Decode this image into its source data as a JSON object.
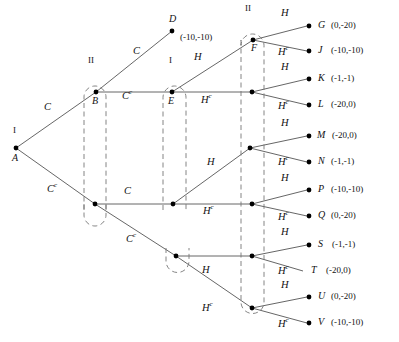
{
  "diagram": {
    "colors": {
      "line": "#555555",
      "dashed": "#777777",
      "node": "#000000",
      "text": "#111111"
    },
    "actions": {
      "C": "C",
      "Cc": "C",
      "Cc_sup": "c",
      "H": "H",
      "Hc": "H",
      "Hc_sup": "c"
    },
    "players": {
      "one": "I",
      "two": "II"
    },
    "decision_nodes": [
      {
        "id": "A",
        "label": "A",
        "player": "I",
        "x": 16,
        "y": 148
      },
      {
        "id": "B",
        "label": "B",
        "player": "II",
        "x": 96,
        "y": 92
      },
      {
        "id": "B2",
        "label": "",
        "player": "II",
        "x": 95,
        "y": 204
      },
      {
        "id": "E",
        "label": "E",
        "player": "I",
        "x": 172,
        "y": 92
      },
      {
        "id": "E2",
        "label": "",
        "player": "I",
        "x": 173,
        "y": 204
      },
      {
        "id": "E3",
        "label": "",
        "player": "I",
        "x": 176,
        "y": 256
      },
      {
        "id": "F",
        "label": "F",
        "player": "II",
        "x": 253,
        "y": 40
      },
      {
        "id": "F2",
        "label": "",
        "player": "II",
        "x": 252,
        "y": 92
      },
      {
        "id": "F3",
        "label": "",
        "player": "II",
        "x": 250,
        "y": 148
      },
      {
        "id": "F4",
        "label": "",
        "player": "II",
        "x": 252,
        "y": 204
      },
      {
        "id": "F5",
        "label": "",
        "player": "II",
        "x": 252,
        "y": 256
      },
      {
        "id": "F6",
        "label": "",
        "player": "II",
        "x": 252,
        "y": 308
      }
    ],
    "terminal_nodes": [
      {
        "id": "D",
        "label": "D",
        "payoff": "(-10,-10)",
        "x": 172,
        "y": 31
      },
      {
        "id": "G",
        "label": "G",
        "payoff": "(0,-20)",
        "x": 313,
        "y": 26
      },
      {
        "id": "J",
        "label": "J",
        "payoff": "(-10,-10)",
        "x": 313,
        "y": 51
      },
      {
        "id": "K",
        "label": "K",
        "payoff": "(-1,-1)",
        "x": 313,
        "y": 79
      },
      {
        "id": "L",
        "label": "L",
        "payoff": "(-20,0)",
        "x": 313,
        "y": 105
      },
      {
        "id": "M",
        "label": "M",
        "payoff": "(-20,0)",
        "x": 313,
        "y": 136
      },
      {
        "id": "N",
        "label": "N",
        "payoff": "(-1,-1)",
        "x": 313,
        "y": 162
      },
      {
        "id": "P",
        "label": "P",
        "payoff": "(-10,-10)",
        "x": 313,
        "y": 190
      },
      {
        "id": "Q",
        "label": "Q",
        "payoff": "(0,-20)",
        "x": 313,
        "y": 216
      },
      {
        "id": "S",
        "label": "S",
        "payoff": "(-1,-1)",
        "x": 313,
        "y": 245
      },
      {
        "id": "T",
        "label": "T",
        "payoff": "(-20,0)",
        "x": 313,
        "y": 271
      },
      {
        "id": "U",
        "label": "U",
        "payoff": "(0,-20)",
        "x": 313,
        "y": 297
      },
      {
        "id": "V",
        "label": "V",
        "payoff": "(-10,-10)",
        "x": 313,
        "y": 323
      }
    ],
    "edge_labels": [
      {
        "text": "C",
        "sup": "",
        "x": 44,
        "y": 108
      },
      {
        "text": "C",
        "sup": "c",
        "x": 47,
        "y": 188
      },
      {
        "text": "C",
        "sup": "",
        "x": 133,
        "y": 52
      },
      {
        "text": "C",
        "sup": "c",
        "x": 124,
        "y": 95
      },
      {
        "text": "C",
        "sup": "",
        "x": 126,
        "y": 192
      },
      {
        "text": "C",
        "sup": "c",
        "x": 128,
        "y": 238
      },
      {
        "text": "H",
        "sup": "",
        "x": 196,
        "y": 58
      },
      {
        "text": "H",
        "sup": "c",
        "x": 203,
        "y": 99
      },
      {
        "text": "H",
        "sup": "",
        "x": 208,
        "y": 163
      },
      {
        "text": "H",
        "sup": "c",
        "x": 205,
        "y": 210
      },
      {
        "text": "H",
        "sup": "",
        "x": 203,
        "y": 271
      },
      {
        "text": "H",
        "sup": "c",
        "x": 203,
        "y": 307
      },
      {
        "text": "H",
        "sup": "",
        "x": 283,
        "y": 14
      },
      {
        "text": "H",
        "sup": "c",
        "x": 280,
        "y": 51
      },
      {
        "text": "H",
        "sup": "",
        "x": 283,
        "y": 68
      },
      {
        "text": "H",
        "sup": "c",
        "x": 280,
        "y": 105
      },
      {
        "text": "H",
        "sup": "",
        "x": 283,
        "y": 124
      },
      {
        "text": "H",
        "sup": "c",
        "x": 280,
        "y": 161
      },
      {
        "text": "H",
        "sup": "",
        "x": 283,
        "y": 179
      },
      {
        "text": "H",
        "sup": "c",
        "x": 280,
        "y": 216
      },
      {
        "text": "H",
        "sup": "",
        "x": 283,
        "y": 233
      },
      {
        "text": "H",
        "sup": "c",
        "x": 280,
        "y": 270
      },
      {
        "text": "H",
        "sup": "",
        "x": 283,
        "y": 286
      },
      {
        "text": "H",
        "sup": "c",
        "x": 280,
        "y": 323
      }
    ],
    "player_labels": [
      {
        "text": "I",
        "x": 13,
        "y": 132
      },
      {
        "text": "II",
        "x": 89,
        "y": 61
      },
      {
        "text": "I",
        "x": 170,
        "y": 61
      },
      {
        "text": "II",
        "x": 247,
        "y": 8
      }
    ],
    "information_sets": [
      {
        "id": "iset-B",
        "x": 84,
        "y": 86,
        "w": 22,
        "h": 124,
        "label": "II"
      },
      {
        "id": "iset-E",
        "x": 163,
        "y": 86,
        "w": 23,
        "h": 124,
        "label": "I"
      },
      {
        "id": "iset-E3",
        "x": 166,
        "y": 248,
        "w": 23,
        "h": 24,
        "label": ""
      },
      {
        "id": "iset-F",
        "x": 241,
        "y": 34,
        "w": 23,
        "h": 280,
        "label": "II"
      }
    ]
  }
}
